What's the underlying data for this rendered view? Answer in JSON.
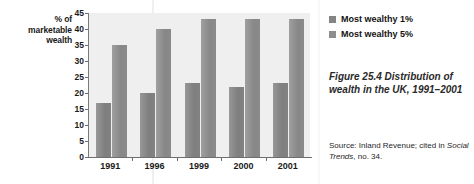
{
  "chart_data": {
    "type": "bar",
    "title": "",
    "categories": [
      "1991",
      "1996",
      "1999",
      "2000",
      "2001"
    ],
    "series": [
      {
        "name": "Most wealthy 1%",
        "values": [
          17,
          20,
          23,
          22,
          23
        ],
        "color": "#848484"
      },
      {
        "name": "Most wealthy 5%",
        "values": [
          35,
          40,
          43,
          43,
          43
        ],
        "color": "#8d8d8d"
      }
    ],
    "xlabel": "",
    "ylabel": "% of marketable wealth",
    "ylim": [
      0,
      45
    ],
    "ytick_step": 5,
    "yticks": [
      "45",
      "40",
      "35",
      "30",
      "25",
      "20",
      "15",
      "10",
      "5",
      "0"
    ],
    "grid": false,
    "legend_position": "right"
  },
  "axis": {
    "y_title_lines": [
      "% of",
      "marketable",
      "wealth"
    ]
  },
  "legend": {
    "items": [
      {
        "label": "Most wealthy 1%",
        "swatch": "#848484"
      },
      {
        "label": "Most wealthy 5%",
        "swatch": "#8d8d8d"
      }
    ]
  },
  "caption": {
    "text": "Figure 25.4  Distribution of wealth in the UK, 1991–2001"
  },
  "source": {
    "prefix": "Source: Inland Revenue; cited in ",
    "italic_title": "Social Trends",
    "suffix": ", no. 34."
  }
}
